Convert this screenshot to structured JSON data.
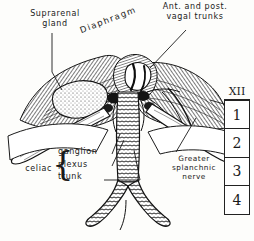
{
  "plate": {
    "title": "Diaphragm and abdominal aorta with celiac plexus",
    "background_color": "#fdfdfb",
    "ink_color": "#1a1a1a"
  },
  "labels": {
    "suprarenal_gland": "Suprarenal\ngland",
    "diaphragm": "Diaphragm",
    "vagal_trunks": "Ant. and post.\nvagal trunks",
    "celiac": "celiac",
    "celiac_items": [
      "ganglion",
      "plexus",
      "trunk"
    ],
    "greater_splanchnic_nerve": "Greater\nsplanchnic\nnerve"
  },
  "vertebra_key": {
    "header": "XII",
    "cells": [
      "1",
      "2",
      "3",
      "4"
    ]
  }
}
